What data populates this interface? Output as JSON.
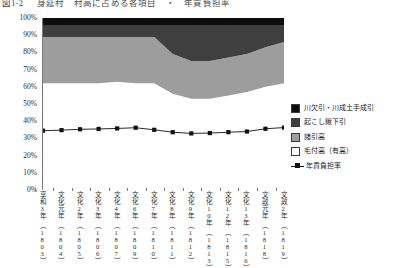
{
  "title": "図1-2 　 身延村　村高に占める各項目　・　年貢負担率",
  "chart_data": {
    "type": "area",
    "stacked_percent": true,
    "title": "図1-2 　 身延村　村高に占める各項目　・　年貢負担率",
    "xlabel": "",
    "ylabel": "",
    "ylim": [
      0,
      100
    ],
    "ytick_labels": [
      "0%",
      "10%",
      "20%",
      "30%",
      "40%",
      "50%",
      "60%",
      "70%",
      "80%",
      "90%",
      "100%"
    ],
    "ytick_values": [
      0,
      10,
      20,
      30,
      40,
      50,
      60,
      70,
      80,
      90,
      100
    ],
    "grid": false,
    "legend_position": "right",
    "categories": [
      "享和3年\n（1803）",
      "文化元年\n（1804）",
      "文化2年\n（1805）",
      "文化3年\n（1806）",
      "文化4年\n（1807）",
      "文化6年\n（1809）",
      "文化7年\n（1810）",
      "文化8年\n（1811）",
      "文化9年\n（1812）",
      "文化10年\n（1813）",
      "文化12年\n（1815）",
      "文化13年\n（1816）",
      "文政元年\n（1818）",
      "文政2年\n（1819）"
    ],
    "category_eras": [
      "享和3年",
      "文化元年",
      "文化2年",
      "文化3年",
      "文化4年",
      "文化6年",
      "文化7年",
      "文化8年",
      "文化9年",
      "文化10年",
      "文化12年",
      "文化13年",
      "文政元年",
      "文政2年"
    ],
    "category_years": [
      "（1803）",
      "（1804）",
      "（1805）",
      "（1806）",
      "（1807）",
      "（1809）",
      "（1810）",
      "（1811）",
      "（1812）",
      "（1813）",
      "（1815）",
      "（1816）",
      "（1818）",
      "（1819）"
    ],
    "series": [
      {
        "name": "毛付高（有高）",
        "color": "#ffffff",
        "values": [
          62,
          62,
          62,
          62,
          63,
          62,
          62,
          56,
          53,
          53,
          55,
          57,
          60,
          62
        ]
      },
      {
        "name": "諸引高",
        "color": "#9d9d9d",
        "values": [
          27,
          27,
          27,
          27,
          26,
          27,
          27,
          23,
          22,
          22,
          22,
          22,
          23,
          24
        ]
      },
      {
        "name": "起こし鍬下引",
        "color": "#3f3f3f",
        "values": [
          7,
          7,
          7,
          7,
          7,
          7,
          7,
          17,
          21,
          21,
          19,
          17,
          13,
          10
        ]
      },
      {
        "name": "川欠引・川成土手成引",
        "color": "#0d0d0d",
        "values": [
          4,
          4,
          4,
          4,
          4,
          4,
          4,
          4,
          4,
          4,
          4,
          4,
          4,
          4
        ]
      }
    ],
    "line_series": {
      "name": "年貢負担率",
      "color": "#111111",
      "marker": "square",
      "values": [
        34.5,
        34.8,
        35.3,
        35.5,
        35.8,
        36.2,
        35.0,
        33.6,
        32.9,
        33.1,
        33.6,
        34.0,
        35.6,
        36.3
      ]
    }
  },
  "legend": {
    "items": [
      {
        "label": "川欠引・川成土手成引",
        "color": "#0d0d0d",
        "type": "swatch"
      },
      {
        "label": "起こし鍬下引",
        "color": "#3f3f3f",
        "type": "swatch"
      },
      {
        "label": "諸引高",
        "color": "#9d9d9d",
        "type": "swatch"
      },
      {
        "label": "毛付高（有高）",
        "color": "#ffffff",
        "type": "swatch"
      },
      {
        "label": "年貢負担率",
        "color": "#111111",
        "type": "line"
      }
    ]
  }
}
